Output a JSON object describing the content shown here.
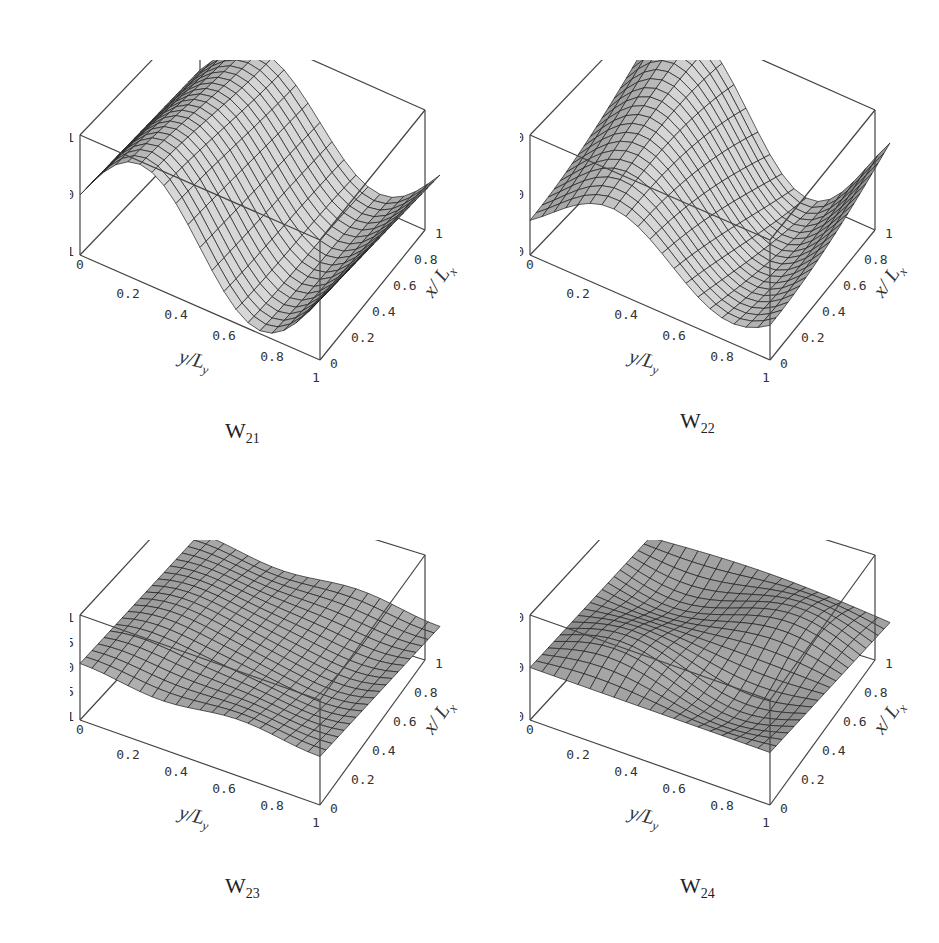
{
  "figure": {
    "panels": [
      {
        "id": "W21",
        "caption_main": "W",
        "caption_sub": "21",
        "mode": [
          2,
          1
        ],
        "z_ticks": [
          "1",
          "0",
          "-1"
        ],
        "surface_shade": "#8a8a8a"
      },
      {
        "id": "W22",
        "caption_main": "W",
        "caption_sub": "22",
        "mode": [
          2,
          2
        ],
        "z_ticks": [
          "1.0",
          "0.0",
          "-1.0"
        ],
        "surface_shade": "#8c8c8c"
      },
      {
        "id": "W23",
        "caption_main": "W",
        "caption_sub": "23",
        "mode": [
          2,
          3
        ],
        "z_ticks": [
          "1",
          "0.5",
          "0",
          "-0.5",
          "-1"
        ],
        "surface_shade": "#6f6f6f"
      },
      {
        "id": "W24",
        "caption_main": "W",
        "caption_sub": "24",
        "mode": [
          2,
          4
        ],
        "z_ticks": [
          "1.0",
          "0.0",
          "-1.0"
        ],
        "surface_shade": "#666666"
      }
    ],
    "y_axis_label": "y/L",
    "y_axis_label_sub": "y",
    "x_axis_label": "x/ L",
    "x_axis_label_sub": "x",
    "y_ticks": [
      "0",
      "0.2",
      "0.4",
      "0.6",
      "0.8",
      "1"
    ],
    "x_ticks": [
      "0",
      "0.2",
      "0.4",
      "0.6",
      "0.8",
      "1"
    ]
  },
  "chart_data": [
    {
      "type": "surface",
      "title": "W21",
      "xlabel": "y/Ly",
      "ylabel": "x/Lx",
      "zlabel": "",
      "xlim": [
        0,
        1
      ],
      "ylim": [
        0,
        1
      ],
      "zlim": [
        -1,
        1
      ],
      "z_ticks": [
        1,
        0,
        -1
      ],
      "x_ticks": [
        0,
        0.2,
        0.4,
        0.6,
        0.8,
        1
      ],
      "y_ticks": [
        0,
        0.2,
        0.4,
        0.6,
        0.8,
        1
      ],
      "description": "Mode shape W21: single sine wave along y/Ly (peak near 0.25, trough near 0.75), nearly uniform along x/Lx",
      "grid": false
    },
    {
      "type": "surface",
      "title": "W22",
      "xlabel": "y/Ly",
      "ylabel": "x/Lx",
      "zlabel": "",
      "xlim": [
        0,
        1
      ],
      "ylim": [
        0,
        1
      ],
      "zlim": [
        -1,
        1
      ],
      "z_ticks": [
        1.0,
        0.0,
        -1.0
      ],
      "x_ticks": [
        0,
        0.2,
        0.4,
        0.6,
        0.8,
        1
      ],
      "y_ticks": [
        0,
        0.2,
        0.4,
        0.6,
        0.8,
        1
      ],
      "description": "Mode shape W22: saddle-like twisted sine surface, trough near y/Ly=0.25 at low x, peak near y/Ly=0.5 at high x",
      "grid": false
    },
    {
      "type": "surface",
      "title": "W23",
      "xlabel": "y/Ly",
      "ylabel": "x/Lx",
      "zlabel": "",
      "xlim": [
        0,
        1
      ],
      "ylim": [
        0,
        1
      ],
      "zlim": [
        -1,
        1
      ],
      "z_ticks": [
        1,
        0.5,
        0,
        -0.5,
        -1
      ],
      "x_ticks": [
        0,
        0.2,
        0.4,
        0.6,
        0.8,
        1
      ],
      "y_ticks": [
        0,
        0.2,
        0.4,
        0.6,
        0.8,
        1
      ],
      "description": "Mode shape W23: low-amplitude undulating surface near z=0",
      "grid": false
    },
    {
      "type": "surface",
      "title": "W24",
      "xlabel": "y/Ly",
      "ylabel": "x/Lx",
      "zlabel": "",
      "xlim": [
        0,
        1
      ],
      "ylim": [
        0,
        1
      ],
      "zlim": [
        -1,
        1
      ],
      "z_ticks": [
        1.0,
        0.0,
        -1.0
      ],
      "x_ticks": [
        0,
        0.2,
        0.4,
        0.6,
        0.8,
        1
      ],
      "y_ticks": [
        0,
        0.2,
        0.4,
        0.6,
        0.8,
        1
      ],
      "description": "Mode shape W24: low-amplitude multi-lobe surface with a ridge near high x/Lx, y/Ly≈0.6",
      "grid": false
    }
  ]
}
